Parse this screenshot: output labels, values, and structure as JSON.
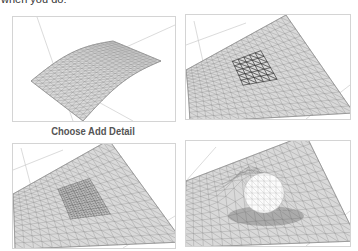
{
  "lead_text": "when you do:",
  "caption": "Choose Add Detail",
  "panels": [
    {
      "name": "initial-terrain-mesh",
      "description": "Curved terrain surface with uniform triangulated grid"
    },
    {
      "name": "selected-region-mesh",
      "description": "Terrain mesh with a selected region of faces highlighted"
    },
    {
      "name": "add-detail-mesh",
      "description": "Terrain mesh with subdivided denser triangles in selected region"
    },
    {
      "name": "smoove-bump-mesh",
      "description": "Terrain mesh with raised bump formed in the detailed region"
    }
  ],
  "colors": {
    "mesh_fill": "#d9d9d9",
    "mesh_line": "#8a8a8a",
    "selection": "#3a3a3a",
    "axis": "#cccccc",
    "border": "#d4d4d4"
  }
}
